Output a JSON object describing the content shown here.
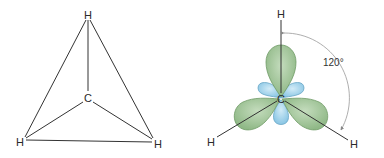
{
  "left_diagram": {
    "title": "tetrahedral projection",
    "atoms": {
      "top": "H",
      "center": "C",
      "bottom_left": "H",
      "bottom_right": "H"
    }
  },
  "right_diagram": {
    "title": "sp2 hybrid orbitals",
    "atoms": {
      "top": "H",
      "center": "C",
      "bottom_left": "H",
      "bottom_right": "H"
    },
    "angle_label": "120°",
    "colors": {
      "large_lobe": "#9cc293",
      "large_lobe_stroke": "#6f9a66",
      "small_lobe": "#9dd0ea",
      "small_lobe_stroke": "#6aa7c6",
      "arc": "#999999"
    }
  }
}
